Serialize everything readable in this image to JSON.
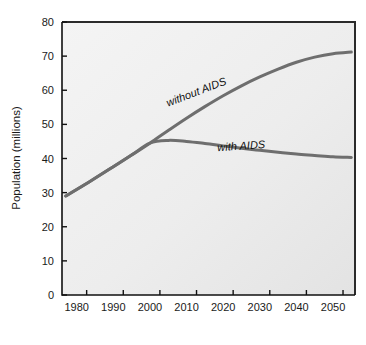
{
  "chart_data": {
    "type": "line",
    "title": "",
    "subtitle": "",
    "xlabel": "",
    "ylabel": "Population (millions)",
    "xlim": [
      1976,
      2056
    ],
    "ylim": [
      0,
      80
    ],
    "grid": false,
    "legend_position": "inline-annotations",
    "x_tick_labels": [
      "1980",
      "1990",
      "2000",
      "2010",
      "2020",
      "2030",
      "2040",
      "2050"
    ],
    "x_ticks": [
      1980,
      1990,
      2000,
      2010,
      2020,
      2030,
      2040,
      2050
    ],
    "y_tick_labels": [
      "0",
      "10",
      "20",
      "30",
      "40",
      "50",
      "60",
      "70",
      "80"
    ],
    "y_ticks": [
      0,
      10,
      20,
      30,
      40,
      50,
      60,
      70,
      80
    ],
    "series": [
      {
        "name": "without AIDS",
        "label": "without AIDS",
        "color": "#6e6e6e",
        "x": [
          1977,
          1980,
          1985,
          1990,
          1995,
          2000,
          2005,
          2010,
          2015,
          2020,
          2025,
          2030,
          2035,
          2040,
          2045,
          2050,
          2055
        ],
        "values": [
          29.0,
          30.9,
          34.2,
          37.6,
          41.0,
          44.5,
          48.2,
          51.8,
          55.2,
          58.4,
          61.3,
          63.9,
          66.2,
          68.2,
          69.7,
          70.7,
          71.2
        ]
      },
      {
        "name": "with AIDS",
        "label": "with AIDS",
        "color": "#6e6e6e",
        "x": [
          1977,
          1980,
          1985,
          1990,
          1995,
          2000,
          2005,
          2010,
          2015,
          2020,
          2025,
          2030,
          2035,
          2040,
          2045,
          2050,
          2055
        ],
        "values": [
          29.0,
          30.9,
          34.2,
          37.6,
          41.0,
          44.5,
          45.3,
          45.0,
          44.4,
          43.7,
          43.0,
          42.4,
          41.8,
          41.3,
          40.9,
          40.5,
          40.3
        ]
      }
    ],
    "annotations": [
      {
        "text": "without AIDS",
        "x": 2013,
        "y": 58.5,
        "rotation": -21
      },
      {
        "text": "with AIDS",
        "x": 2025,
        "y": 42.6,
        "rotation": -4
      }
    ],
    "colors": {
      "line": "#6e6e6e",
      "axis": "#1a1a1a",
      "plot_background": "#ececec",
      "page_background": "#ffffff",
      "text": "#1a1a1a"
    }
  }
}
